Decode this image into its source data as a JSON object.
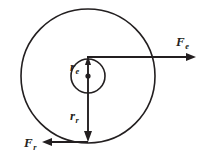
{
  "figure": {
    "kind": "physics-vector-diagram",
    "background_color": "#ffffff",
    "stroke_color": "#231f20",
    "labels": {
      "inner_radius": {
        "base": "r",
        "sub": "e"
      },
      "outer_radius": {
        "base": "r",
        "sub": "r"
      },
      "force_right": {
        "base": "F",
        "sub": "e"
      },
      "force_left": {
        "base": "F",
        "sub": "r"
      }
    },
    "geometry": {
      "center": {
        "x": 88,
        "y": 76
      },
      "inner_circle_radius": 17,
      "outer_circle_radius": 67,
      "inner_radius_vector": {
        "from_y": 76,
        "to_y": 58,
        "direction": "up"
      },
      "outer_radius_vector": {
        "from_y": 76,
        "to_y": 142,
        "direction": "down"
      },
      "force_right_vector": {
        "y": 57,
        "from_x": 87,
        "to_x": 196,
        "direction": "right"
      },
      "force_left_vector": {
        "y": 142,
        "from_x": 88,
        "to_x": 42,
        "direction": "left"
      }
    }
  }
}
